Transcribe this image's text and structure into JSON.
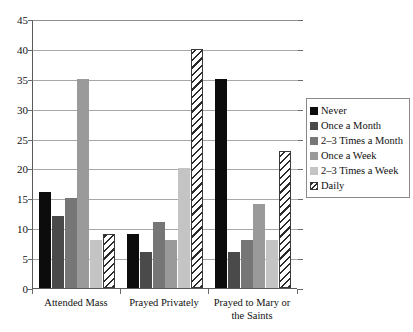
{
  "chart_data": {
    "type": "bar",
    "title": "",
    "xlabel": "",
    "ylabel": "",
    "ylim": [
      0,
      45
    ],
    "ytick_step": 5,
    "yticks": [
      45,
      40,
      35,
      30,
      25,
      20,
      15,
      10,
      5,
      0
    ],
    "grid": true,
    "legend_position": "right",
    "categories": [
      "Attended Mass",
      "Prayed Privately",
      "Prayed to Mary or the Saints"
    ],
    "series": [
      {
        "name": "Never",
        "color": "#0c0c0c",
        "values": [
          16,
          9,
          35
        ]
      },
      {
        "name": "Once a Month",
        "color": "#4a4a4a",
        "values": [
          12,
          6,
          6
        ]
      },
      {
        "name": "2–3 Times a Month",
        "color": "#767676",
        "values": [
          15,
          11,
          8
        ]
      },
      {
        "name": "Once a Week",
        "color": "#9a9a9a",
        "values": [
          35,
          8,
          14
        ]
      },
      {
        "name": "2–3 Times a Week",
        "color": "#c4c4c4",
        "values": [
          8,
          20,
          8
        ]
      },
      {
        "name": "Daily",
        "color": "#ffffff",
        "values": [
          9,
          40,
          23
        ]
      }
    ]
  },
  "category_label_lines": [
    [
      "Attended Mass"
    ],
    [
      "Prayed Privately"
    ],
    [
      "Prayed to Mary or",
      "the Saints"
    ]
  ]
}
